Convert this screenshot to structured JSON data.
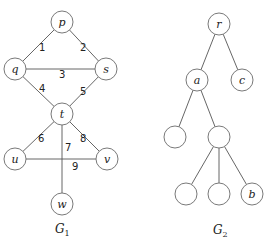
{
  "graphs": [
    {
      "id": "G1",
      "caption": {
        "base": "G",
        "sub": "1",
        "x": 55,
        "y": 233
      },
      "nodes": [
        {
          "id": "p",
          "label": "p",
          "x": 62,
          "y": 22
        },
        {
          "id": "q",
          "label": "q",
          "x": 15,
          "y": 69
        },
        {
          "id": "s",
          "label": "s",
          "x": 106,
          "y": 69
        },
        {
          "id": "t",
          "label": "t",
          "x": 62,
          "y": 114
        },
        {
          "id": "u",
          "label": "u",
          "x": 15,
          "y": 159
        },
        {
          "id": "v",
          "label": "v",
          "x": 107,
          "y": 159
        },
        {
          "id": "w",
          "label": "w",
          "x": 62,
          "y": 204
        }
      ],
      "edges": [
        {
          "from": "p",
          "to": "q",
          "label": "1",
          "lx": 39,
          "ly": 51
        },
        {
          "from": "p",
          "to": "s",
          "label": "2",
          "lx": 80,
          "ly": 51
        },
        {
          "from": "q",
          "to": "s",
          "label": "3",
          "lx": 59,
          "ly": 78
        },
        {
          "from": "q",
          "to": "t",
          "label": "4",
          "lx": 39,
          "ly": 92
        },
        {
          "from": "t",
          "to": "s",
          "label": "5",
          "lx": 80,
          "ly": 95
        },
        {
          "from": "t",
          "to": "u",
          "label": "6",
          "lx": 38,
          "ly": 142
        },
        {
          "from": "t",
          "to": "w",
          "label": "7",
          "lx": 65,
          "ly": 151
        },
        {
          "from": "t",
          "to": "v",
          "label": "8",
          "lx": 80,
          "ly": 142
        },
        {
          "from": "u",
          "to": "v",
          "label": "9",
          "lx": 72,
          "ly": 170
        }
      ]
    },
    {
      "id": "G2",
      "caption": {
        "base": "G",
        "sub": "2",
        "x": 213,
        "y": 234
      },
      "nodes": [
        {
          "id": "r",
          "label": "r",
          "x": 219,
          "y": 24
        },
        {
          "id": "a",
          "label": "a",
          "x": 197,
          "y": 80
        },
        {
          "id": "c",
          "label": "c",
          "x": 242,
          "y": 80
        },
        {
          "id": "n1",
          "label": "",
          "x": 175,
          "y": 137
        },
        {
          "id": "n2",
          "label": "",
          "x": 219,
          "y": 137
        },
        {
          "id": "n3",
          "label": "",
          "x": 186,
          "y": 194
        },
        {
          "id": "n4",
          "label": "",
          "x": 219,
          "y": 194
        },
        {
          "id": "b",
          "label": "b",
          "x": 252,
          "y": 194
        }
      ],
      "edges": [
        {
          "from": "r",
          "to": "a",
          "label": ""
        },
        {
          "from": "r",
          "to": "c",
          "label": ""
        },
        {
          "from": "a",
          "to": "n1",
          "label": ""
        },
        {
          "from": "a",
          "to": "n2",
          "label": ""
        },
        {
          "from": "n2",
          "to": "n3",
          "label": ""
        },
        {
          "from": "n2",
          "to": "n4",
          "label": ""
        },
        {
          "from": "n2",
          "to": "b",
          "label": ""
        }
      ]
    }
  ],
  "style": {
    "node_radius": 11,
    "edge_color": "#555555",
    "node_stroke": "#6a6a6a",
    "background": "#ffffff"
  }
}
